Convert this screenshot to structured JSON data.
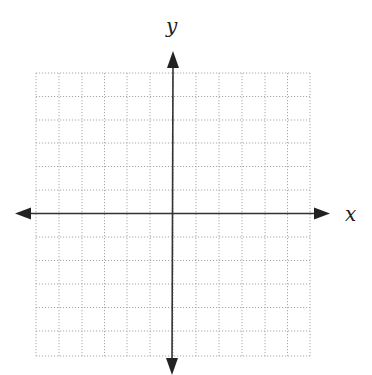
{
  "diagram": {
    "type": "coordinate-plane",
    "axes": {
      "x_label": "x",
      "y_label": "y",
      "color": "#333333",
      "arrows": "both-ends"
    },
    "grid": {
      "columns": 12,
      "rows": 12,
      "cells_left_of_y_axis": 6,
      "cells_right_of_y_axis": 6,
      "cells_above_x_axis": 6,
      "cells_below_x_axis": 6,
      "line_style": "dotted",
      "line_color": "#aaaaaa"
    }
  }
}
